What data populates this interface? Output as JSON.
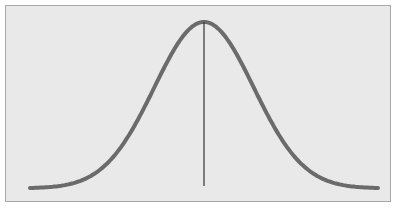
{
  "chart_data": {
    "type": "line",
    "title": "",
    "xlabel": "",
    "ylabel": "",
    "series": [
      {
        "name": "normal-distribution",
        "mean": 0,
        "std": 1,
        "x_range": [
          -3.5,
          3.5
        ]
      }
    ],
    "annotations": [
      {
        "type": "vertical-line",
        "x": 0,
        "label": ""
      }
    ],
    "grid": false,
    "legend": "none",
    "colors": {
      "background": "#e9e9e9",
      "curve": "#6b6b6b",
      "mean_line": "#333333",
      "border": "#a8a8a8"
    }
  }
}
